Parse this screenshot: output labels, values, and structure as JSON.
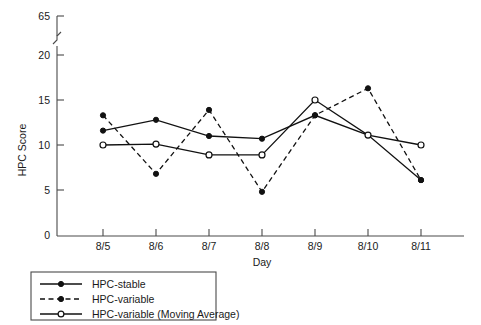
{
  "chart_data": {
    "type": "line",
    "title": "",
    "xlabel": "Day",
    "ylabel": "HPC Score",
    "categories": [
      "8/5",
      "8/6",
      "8/7",
      "8/8",
      "8/9",
      "8/10",
      "8/11"
    ],
    "ylim": [
      0,
      20
    ],
    "yticks": [
      0,
      5,
      10,
      15,
      20
    ],
    "ytick_labels": [
      "0",
      "5",
      "10",
      "15",
      "20"
    ],
    "axis_break": {
      "present": true,
      "top_tick_value": 65,
      "top_tick_label": "65"
    },
    "grid": false,
    "legend_position": "below-left",
    "series": [
      {
        "name": "HPC-stable",
        "line_style": "solid",
        "marker": "filled-circle",
        "values": [
          11.6,
          12.8,
          11.0,
          10.7,
          13.3,
          11.1,
          6.1
        ]
      },
      {
        "name": "HPC-variable",
        "line_style": "dashed",
        "marker": "filled-circle",
        "values": [
          13.3,
          6.8,
          13.9,
          4.8,
          13.3,
          16.3,
          6.1
        ]
      },
      {
        "name": "HPC-variable (Moving Average)",
        "line_style": "solid",
        "marker": "open-circle",
        "values": [
          10.0,
          10.1,
          8.9,
          8.9,
          15.0,
          11.1,
          10.0
        ]
      }
    ],
    "colors": {
      "series_stroke": "#111111",
      "axis": "#4a4a4a",
      "background": "#ffffff"
    }
  },
  "legend": {
    "items": [
      {
        "label": "HPC-stable"
      },
      {
        "label": "HPC-variable"
      },
      {
        "label": "HPC-variable (Moving Average)"
      }
    ]
  },
  "axes": {
    "y_title": "HPC Score",
    "x_title": "Day",
    "y_labels": [
      "65",
      "20",
      "15",
      "10",
      "5",
      "0"
    ],
    "x_labels": [
      "8/5",
      "8/6",
      "8/7",
      "8/8",
      "8/9",
      "8/10",
      "8/11"
    ]
  }
}
